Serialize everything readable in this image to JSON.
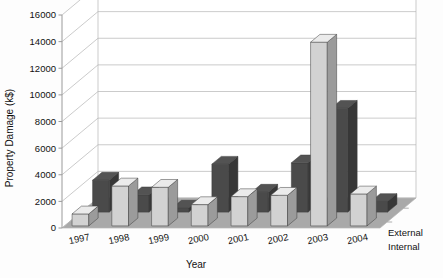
{
  "chart_data": {
    "type": "bar",
    "title": "",
    "subtitle": "",
    "xlabel": "Year",
    "ylabel": "Property Damage (k$)",
    "categories": [
      "1997",
      "1998",
      "1999",
      "2000",
      "2001",
      "2002",
      "2003",
      "2004"
    ],
    "series": [
      {
        "name": "External",
        "color": "#d2d2d2",
        "values": [
          900,
          3000,
          2900,
          1600,
          2200,
          2300,
          13800,
          2400
        ]
      },
      {
        "name": "Internal",
        "color": "#4a4a4a",
        "values": [
          2400,
          1300,
          300,
          3600,
          1500,
          3700,
          7800,
          800
        ]
      }
    ],
    "ylim": [
      0,
      16000
    ],
    "yticks": [
      0,
      2000,
      4000,
      6000,
      8000,
      10000,
      12000,
      14000,
      16000
    ],
    "ytick_labels": [
      "0",
      "2000",
      "4000",
      "6000",
      "8000",
      "10000",
      "12000",
      "14000",
      "16000"
    ],
    "grid": true,
    "grid_axis": "y",
    "legend_position": "right-bottom",
    "projection": "3d",
    "background_color": "#ffffff",
    "floor_color": "#a9a9a9",
    "grid_color": "#b4b4b4",
    "axis_color": "#9a9a9a"
  },
  "legend": {
    "entries": [
      {
        "label": "External"
      },
      {
        "label": "Internal"
      }
    ]
  },
  "axes": {
    "y_title": "Property Damage (k$)",
    "x_title": "Year"
  }
}
